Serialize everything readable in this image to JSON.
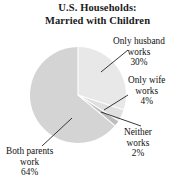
{
  "chart_data": {
    "type": "pie",
    "title": "U.S. Households: Married with Children",
    "title_lines": [
      "U.S. Households:",
      "Married with Children"
    ],
    "xlabel": "",
    "ylabel": "",
    "legend_position": "none",
    "grid": false,
    "start_angle_deg": 0,
    "direction": "clockwise",
    "categories": [
      "Only husband works",
      "Only wife works",
      "Neither works",
      "Both parents work"
    ],
    "values": [
      30,
      4,
      2,
      64
    ],
    "unit": "%",
    "total": 100,
    "slices": [
      {
        "name": "Only husband works",
        "value": 30,
        "value_label": "30%",
        "label_lines": [
          "Only husband",
          "works",
          "30%"
        ],
        "color": "#e8e8e8",
        "start_deg": 0,
        "end_deg": 108,
        "leader_line": true
      },
      {
        "name": "Only wife works",
        "value": 4,
        "value_label": "4%",
        "label_lines": [
          "Only wife",
          "works",
          "4%"
        ],
        "color": "#e0e0e0",
        "start_deg": 108,
        "end_deg": 122.4,
        "leader_line": true
      },
      {
        "name": "Neither works",
        "value": 2,
        "value_label": "2%",
        "label_lines": [
          "Neither",
          "works",
          "2%"
        ],
        "color": "#bdbdbd",
        "start_deg": 122.4,
        "end_deg": 129.6,
        "leader_line": true
      },
      {
        "name": "Both parents work",
        "value": 64,
        "value_label": "64%",
        "label_lines": [
          "Both parents",
          "work",
          "64%"
        ],
        "color": "#d4d4d4",
        "start_deg": 129.6,
        "end_deg": 360,
        "leader_line": true
      }
    ],
    "colors": {
      "slice_husband": "#e8e8e8",
      "slice_wife": "#e0e0e0",
      "slice_neither": "#bdbdbd",
      "slice_both": "#d4d4d4",
      "separator": "#ffffff",
      "leader_line": "#222222",
      "text": "#111111",
      "background": "#ffffff"
    }
  }
}
